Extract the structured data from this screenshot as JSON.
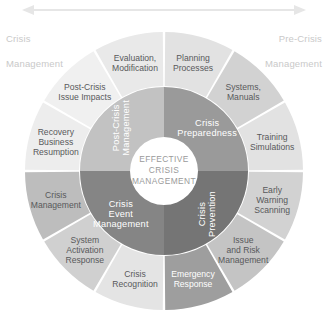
{
  "diagram": {
    "hub": {
      "line1": "EFFECTIVE",
      "line2": "CRISIS",
      "line3": "MANAGEMENT",
      "color": "#ffffff",
      "text_color": "#9a9a9a"
    },
    "top_arrow": {
      "name": "double-headed-arrow",
      "color": "#e6e6e6",
      "direction": "both"
    },
    "phase_headers": [
      {
        "id": "crisis-management",
        "line1": "Crisis",
        "line2": "Management",
        "side": "left",
        "color": "#c9c9c9"
      },
      {
        "id": "pre-crisis-management",
        "line1": "Pre-Crisis",
        "line2": "Management",
        "side": "right",
        "color": "#c9c9c9"
      }
    ],
    "inner_ring": [
      {
        "id": "crisis-preparedness",
        "label": "Crisis Preparedness",
        "color": "#9a9a9a",
        "text_color": "#ffffff",
        "start_angle": 0,
        "end_angle": 90
      },
      {
        "id": "crisis-prevention",
        "label": "Crisis Prevention",
        "color": "#757575",
        "text_color": "#ffffff",
        "start_angle": 90,
        "end_angle": 180
      },
      {
        "id": "crisis-event-management",
        "label": "Crisis Event Management",
        "color": "#858585",
        "text_color": "#ffffff",
        "start_angle": 180,
        "end_angle": 270
      },
      {
        "id": "post-crisis-management",
        "label": "Post-Crisis Management",
        "color": "#c2c2c2",
        "text_color": "#ffffff",
        "start_angle": 270,
        "end_angle": 360
      }
    ],
    "outer_ring": [
      {
        "id": "planning-processes",
        "line1": "Planning",
        "line2": "Processes",
        "line3": "",
        "color": "#e2e2e2",
        "text_color": "#58595b"
      },
      {
        "id": "systems-manuals",
        "line1": "Systems,",
        "line2": "Manuals",
        "line3": "",
        "color": "#d2d2d2",
        "text_color": "#58595b"
      },
      {
        "id": "training-simulations",
        "line1": "Training",
        "line2": "Simulations",
        "line3": "",
        "color": "#e2e2e2",
        "text_color": "#58595b"
      },
      {
        "id": "early-warning-scanning",
        "line1": "Early",
        "line2": "Warning",
        "line3": "Scanning",
        "color": "#d2d2d2",
        "text_color": "#58595b"
      },
      {
        "id": "issue-and-risk-management",
        "line1": "Issue",
        "line2": "and Risk",
        "line3": "Management",
        "color": "#c4c4c4",
        "text_color": "#58595b"
      },
      {
        "id": "emergency-response",
        "line1": "Emergency",
        "line2": "Response",
        "line3": "",
        "color": "#9e9e9e",
        "text_color": "#ffffff"
      },
      {
        "id": "crisis-recognition",
        "line1": "Crisis",
        "line2": "Recognition",
        "line3": "",
        "color": "#e4e4e4",
        "text_color": "#58595b"
      },
      {
        "id": "system-activation-response",
        "line1": "System",
        "line2": "Activation",
        "line3": "Response",
        "color": "#d0d0d0",
        "text_color": "#58595b"
      },
      {
        "id": "crisis-management-outer",
        "line1": "Crisis",
        "line2": "Management",
        "line3": "",
        "color": "#bdbdbd",
        "text_color": "#58595b"
      },
      {
        "id": "recovery-business-resumption",
        "line1": "Recovery",
        "line2": "Business",
        "line3": "Resumption",
        "color": "#ededed",
        "text_color": "#58595b"
      },
      {
        "id": "post-crisis-issue-impacts",
        "line1": "Post-Crisis",
        "line2": "Issue Impacts",
        "line3": "",
        "color": "#f0f0f0",
        "text_color": "#58595b"
      },
      {
        "id": "evaluation-modification",
        "line1": "Evaluation,",
        "line2": "Modification",
        "line3": "",
        "color": "#e9e9e9",
        "text_color": "#58595b"
      }
    ]
  }
}
